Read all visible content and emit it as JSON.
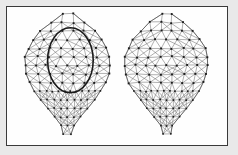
{
  "figure": {
    "caption": "",
    "frame": {
      "border_color": "#3a3a3a",
      "background_color": "#fefefe",
      "outer_background_color": "#e9e9e9",
      "x": 6,
      "y": 6,
      "width": 222,
      "height": 140
    },
    "edge_color": "#6e6e6e",
    "node_color": "#1c1c1c",
    "annotation_color": "#1a1a1a"
  },
  "chart_data": {
    "type": "scatter",
    "title": "",
    "subtitle": "",
    "xlabel": "",
    "ylabel": "",
    "grid": false,
    "legend": "none",
    "models": [
      {
        "name": "left-face-mesh",
        "label": "",
        "center_x": 67,
        "center_y": 74,
        "width": 86,
        "height": 122,
        "vertex_count": 118,
        "annotated": true
      },
      {
        "name": "right-face-mesh",
        "label": "",
        "center_x": 167,
        "center_y": 74,
        "width": 84,
        "height": 122,
        "vertex_count": 118,
        "annotated": false
      }
    ],
    "annotations": [
      {
        "name": "region-of-interest-ellipse",
        "shape": "ellipse",
        "target_model": "left-face-mesh",
        "cx": 70,
        "cy": 60,
        "rx": 23,
        "ry": 33,
        "color": "#1a1a1a",
        "stroke_width": 1.6,
        "label": ""
      }
    ],
    "mesh_rows": [
      {
        "y": 16,
        "x": [
          52,
          68,
          84
        ],
        "dense": false
      },
      {
        "y": 23,
        "x": [
          42,
          52,
          62,
          74,
          86,
          96
        ],
        "dense": false
      },
      {
        "y": 31,
        "x": [
          35,
          45,
          56,
          68,
          80,
          91,
          101
        ],
        "dense": false
      },
      {
        "y": 40,
        "x": [
          31,
          41,
          52,
          63,
          74,
          86,
          97,
          105
        ],
        "dense": false
      },
      {
        "y": 50,
        "x": [
          29,
          39,
          50,
          61,
          72,
          84,
          95,
          106
        ],
        "dense": false
      },
      {
        "y": 60,
        "x": [
          28,
          38,
          49,
          60,
          71,
          83,
          94,
          106
        ],
        "dense": false
      },
      {
        "y": 70,
        "x": [
          29,
          39,
          50,
          61,
          72,
          84,
          95,
          106
        ],
        "dense": false
      },
      {
        "y": 80,
        "x": [
          31,
          41,
          52,
          63,
          74,
          85,
          96,
          104
        ],
        "dense": false
      },
      {
        "y": 89,
        "x": [
          34,
          44,
          54,
          64,
          75,
          86,
          96,
          102
        ],
        "dense": true
      },
      {
        "y": 96,
        "x": [
          36,
          44,
          52,
          60,
          68,
          76,
          84,
          92,
          99
        ],
        "dense": true
      },
      {
        "y": 103,
        "x": [
          38,
          46,
          53,
          61,
          68,
          76,
          83,
          91,
          97
        ],
        "dense": true
      },
      {
        "y": 110,
        "x": [
          41,
          48,
          55,
          62,
          69,
          76,
          83,
          90,
          95
        ],
        "dense": true
      },
      {
        "y": 117,
        "x": [
          46,
          53,
          60,
          67,
          74,
          81,
          88
        ],
        "dense": true
      },
      {
        "y": 124,
        "x": [
          52,
          60,
          68,
          76,
          84
        ],
        "dense": true
      },
      {
        "y": 131,
        "x": [
          62,
          70,
          78
        ],
        "dense": true
      }
    ]
  }
}
